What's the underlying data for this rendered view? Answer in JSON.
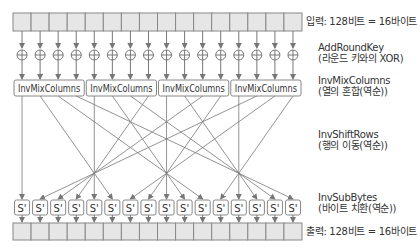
{
  "diagram": {
    "input_label": "입력: 128비트 = 16바이트",
    "output_label": "출력: 128비트 = 16바이트",
    "byte_count": 16,
    "stages": [
      {
        "name": "AddRoundKey",
        "desc": "(라운드 키와의 XOR)"
      },
      {
        "name": "InvMixColumns",
        "desc": "(열의 혼합(역순))"
      },
      {
        "name": "InvShiftRows",
        "desc": "(행의 이동(역순))"
      },
      {
        "name": "InvSubBytes",
        "desc": "(바이트 치환(역순))"
      }
    ],
    "mix_boxes": [
      "InvMixColumns",
      "InvMixColumns",
      "InvMixColumns",
      "InvMixColumns"
    ],
    "sbox_label": "S'",
    "xor_symbol": "⊕",
    "colors": {
      "cell_fill": "#e6e6e6",
      "stroke": "#888888",
      "line": "#777777",
      "text": "#333333"
    }
  }
}
